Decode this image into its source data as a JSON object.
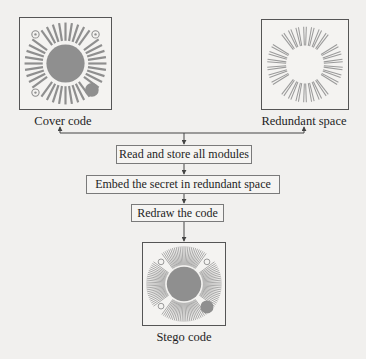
{
  "diagram": {
    "nodes": {
      "cover_code": {
        "label": "Cover code",
        "icon": "radial-code-full"
      },
      "redundant_space": {
        "label": "Redundant space",
        "icon": "radial-code-redundant-only"
      },
      "stego_code": {
        "label": "Stego code",
        "icon": "radial-code-dense"
      }
    },
    "steps": [
      {
        "label": "Read and store all modules"
      },
      {
        "label": "Embed the secret in redundant space"
      },
      {
        "label": "Redraw the code"
      }
    ],
    "edges": [
      {
        "from": "steps.0",
        "to": "cover_code",
        "style": "arrow"
      },
      {
        "from": "steps.0",
        "to": "redundant_space",
        "style": "arrow"
      },
      {
        "from": "steps.0",
        "to": "steps.1",
        "style": "arrow"
      },
      {
        "from": "steps.1",
        "to": "steps.2",
        "style": "arrow"
      },
      {
        "from": "steps.2",
        "to": "stego_code",
        "style": "arrow"
      }
    ],
    "colors": {
      "line": "#444444",
      "module_gray": "#8f8f8f",
      "background": "#f1f0ee"
    }
  }
}
